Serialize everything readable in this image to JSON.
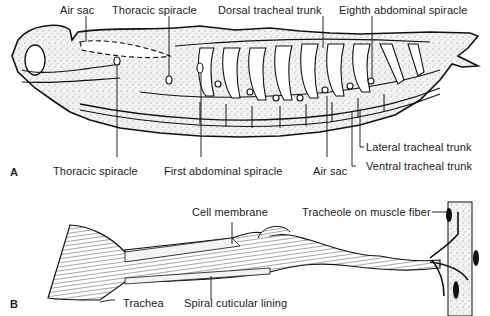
{
  "figure": {
    "panel_a": {
      "letter": "A",
      "labels": {
        "air_sac_top": "Air sac",
        "thoracic_spiracle_top": "Thoracic spiracle",
        "dorsal_tracheal_trunk": "Dorsal tracheal trunk",
        "eighth_abdominal_spiracle": "Eighth abdominal spiracle",
        "lateral_tracheal_trunk": "Lateral tracheal trunk",
        "ventral_tracheal_trunk": "Ventral tracheal trunk",
        "thoracic_spiracle_bottom": "Thoracic spiracle",
        "first_abdominal_spiracle": "First abdominal spiracle",
        "air_sac_bottom": "Air sac"
      }
    },
    "panel_b": {
      "letter": "B",
      "labels": {
        "cell_membrane": "Cell membrane",
        "tracheole_on_muscle_fiber": "Tracheole on muscle fiber",
        "trachea": "Trachea",
        "spiral_cuticular_lining": "Spiral cuticular lining"
      }
    }
  }
}
